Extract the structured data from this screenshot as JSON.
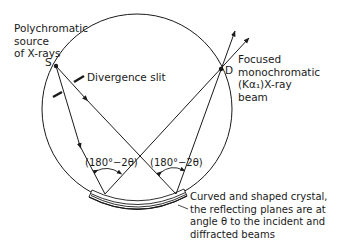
{
  "diagram": {
    "labels": {
      "source": [
        "Polychromatic",
        "source",
        "of X-rays"
      ],
      "point_s": "S",
      "divergence_slit": "Divergence slit",
      "point_d": "D",
      "beam": [
        "Focused",
        "monochromatic",
        "(Kα₁)X-ray",
        "beam"
      ],
      "angle_left": "(180°−2θ)",
      "angle_right": "(180°−2θ)",
      "crystal": [
        "Curved and shaped crystal,",
        "the reflecting planes are at",
        "angle θ to the incident and",
        "diffracted beams"
      ]
    },
    "colors": {
      "line": "#1a1a1a",
      "background": "#ffffff"
    }
  }
}
